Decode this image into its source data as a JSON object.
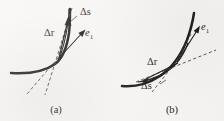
{
  "figure": {
    "background_color": "#f7f6f4",
    "ink_color": "#141210",
    "panels": [
      {
        "id": "a",
        "caption": "(a)",
        "labels": {
          "delta_r": "Δr",
          "delta_s": "Δs",
          "unit_tangent": "e",
          "unit_tangent_subscript": "1"
        },
        "elements": [
          "thick-curve",
          "chord-arrow-delta-r",
          "arc-label-delta-s",
          "tangent-vector-e1",
          "dashed-secant-line",
          "dashed-tangent-line"
        ]
      },
      {
        "id": "b",
        "caption": "(b)",
        "labels": {
          "delta_r": "Δr",
          "delta_s": "Δs",
          "unit_tangent": "e",
          "unit_tangent_subscript": "1"
        },
        "elements": [
          "thick-curve",
          "chord-arrow-delta-r",
          "arc-label-delta-s",
          "tangent-vector-e1",
          "dashed-secant-line",
          "dashed-tangent-line"
        ]
      }
    ]
  }
}
